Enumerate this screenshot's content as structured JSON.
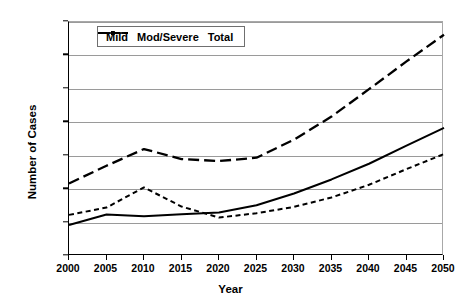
{
  "chart_data": {
    "type": "line",
    "title": "",
    "xlabel": "Year",
    "ylabel": "Number of Cases",
    "x": [
      2000,
      2005,
      2010,
      2015,
      2020,
      2025,
      2030,
      2035,
      2040,
      2045,
      2050
    ],
    "categories": [
      "2000",
      "2005",
      "2010",
      "2015",
      "2020",
      "2025",
      "2030",
      "2035",
      "2040",
      "2045",
      "2050"
    ],
    "xlim": [
      2000,
      2050
    ],
    "ylim": [
      0,
      7000000
    ],
    "ytick_labels": [
      "0",
      "1000000",
      "2000000",
      "3000000",
      "4000000",
      "5000000",
      "6000000",
      "7000000"
    ],
    "ytick_values": [
      0,
      1000000,
      2000000,
      3000000,
      4000000,
      5000000,
      6000000,
      7000000
    ],
    "grid": true,
    "legend_position": "top-left-inside",
    "series": [
      {
        "name": "Mild",
        "style": "solid",
        "marker": "none",
        "color": "#000000",
        "values": [
          930000,
          1240000,
          1190000,
          1250000,
          1300000,
          1520000,
          1870000,
          2290000,
          2760000,
          3300000,
          3830000
        ]
      },
      {
        "name": "Mod/Severe",
        "style": "dotted",
        "marker": "none",
        "color": "#000000",
        "values": [
          1230000,
          1450000,
          2050000,
          1480000,
          1150000,
          1280000,
          1470000,
          1750000,
          2130000,
          2600000,
          3050000
        ]
      },
      {
        "name": "Total",
        "style": "dashed",
        "marker": "none",
        "color": "#000000",
        "values": [
          2170000,
          2700000,
          3200000,
          2900000,
          2840000,
          2940000,
          3480000,
          4170000,
          4990000,
          5820000,
          6620000
        ]
      }
    ]
  }
}
